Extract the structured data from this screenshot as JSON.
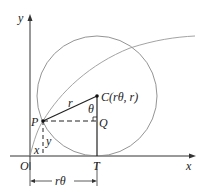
{
  "diagram": {
    "axes": {
      "x_label": "x",
      "y_label": "y",
      "origin_label": "O"
    },
    "points": {
      "P": "P",
      "C": "C(rθ, r)",
      "Q": "Q",
      "T": "T"
    },
    "segments": {
      "radius": "r",
      "angle": "θ",
      "vertical_y": "y",
      "horizontal_x": "x",
      "arc_length": "rθ"
    },
    "colors": {
      "curve": "#999999",
      "lines": "#222222"
    }
  }
}
